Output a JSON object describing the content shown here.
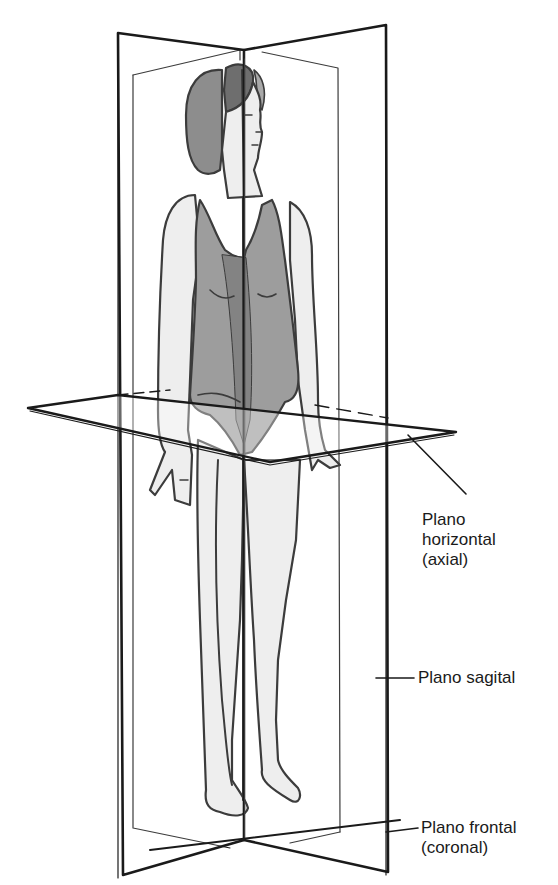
{
  "figure": {
    "colors": {
      "line": "#1a1a1a",
      "skin": "#ececec",
      "suit": "#8c8c8c",
      "suit_dark": "#6e6e6e",
      "hair": "#7a7a7a",
      "hair_dark": "#555555",
      "plane_fill": "rgba(255,255,255,0.25)",
      "background": "#ffffff"
    }
  },
  "labels": {
    "horizontal": {
      "line1": "Plano",
      "line2": "horizontal",
      "line3": "(axial)"
    },
    "sagittal": {
      "line1": "Plano sagital"
    },
    "frontal": {
      "line1": "Plano frontal",
      "line2": "(coronal)"
    }
  }
}
